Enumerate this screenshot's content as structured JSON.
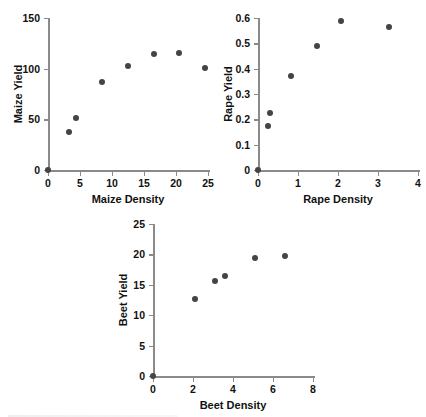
{
  "figure": {
    "background": "#ffffff",
    "marker_color": "#444444",
    "axis_color": "#8a8a8a"
  },
  "chart_data": [
    {
      "type": "scatter",
      "title": "",
      "xlabel": "Maize Density",
      "ylabel": "Maize Yield",
      "xlim": [
        0,
        25
      ],
      "ylim": [
        0,
        150
      ],
      "xticks": [
        0,
        5,
        10,
        15,
        20,
        25
      ],
      "yticks": [
        0,
        50,
        100,
        150
      ],
      "xtick_labels": [
        "0",
        "5",
        "10",
        "15",
        "20",
        "25"
      ],
      "ytick_labels": [
        "0",
        "50",
        "100",
        "150"
      ],
      "grid": false,
      "legend": "none",
      "points": [
        {
          "x": 0.0,
          "y": 0.0
        },
        {
          "x": 3.3,
          "y": 37.5
        },
        {
          "x": 4.3,
          "y": 51.5
        },
        {
          "x": 8.5,
          "y": 86.5
        },
        {
          "x": 12.5,
          "y": 102.5
        },
        {
          "x": 16.5,
          "y": 114.0
        },
        {
          "x": 20.5,
          "y": 115.0
        },
        {
          "x": 24.5,
          "y": 101.0
        }
      ]
    },
    {
      "type": "scatter",
      "title": "",
      "xlabel": "Rape Density",
      "ylabel": "Rape Yield",
      "xlim": [
        0,
        4
      ],
      "ylim": [
        0,
        0.6
      ],
      "xticks": [
        0,
        1,
        2,
        3,
        4
      ],
      "yticks": [
        0,
        0.1,
        0.2,
        0.3,
        0.4,
        0.5,
        0.6
      ],
      "xtick_labels": [
        "0",
        "1",
        "2",
        "3",
        "4"
      ],
      "ytick_labels": [
        "0",
        "0.1",
        "0.2",
        "0.3",
        "0.4",
        "0.5",
        "0.6"
      ],
      "grid": false,
      "legend": "none",
      "points": [
        {
          "x": 0.0,
          "y": 0.0
        },
        {
          "x": 0.26,
          "y": 0.172
        },
        {
          "x": 0.29,
          "y": 0.225
        },
        {
          "x": 0.82,
          "y": 0.372
        },
        {
          "x": 1.47,
          "y": 0.488
        },
        {
          "x": 2.07,
          "y": 0.588
        },
        {
          "x": 3.28,
          "y": 0.565
        }
      ]
    },
    {
      "type": "scatter",
      "title": "",
      "xlabel": "Beet Density",
      "ylabel": "Beet Yield",
      "xlim": [
        0,
        8
      ],
      "ylim": [
        0,
        25
      ],
      "xticks": [
        0,
        2,
        4,
        6,
        8
      ],
      "yticks": [
        0,
        5,
        10,
        15,
        20,
        25
      ],
      "xtick_labels": [
        "0",
        "2",
        "4",
        "6",
        "8"
      ],
      "ytick_labels": [
        "0",
        "5",
        "10",
        "15",
        "20",
        "25"
      ],
      "grid": false,
      "legend": "none",
      "points": [
        {
          "x": 0.0,
          "y": 0.0
        },
        {
          "x": 2.1,
          "y": 12.6
        },
        {
          "x": 3.1,
          "y": 15.6
        },
        {
          "x": 3.6,
          "y": 16.5
        },
        {
          "x": 5.1,
          "y": 19.4
        },
        {
          "x": 6.6,
          "y": 19.8
        }
      ]
    }
  ]
}
